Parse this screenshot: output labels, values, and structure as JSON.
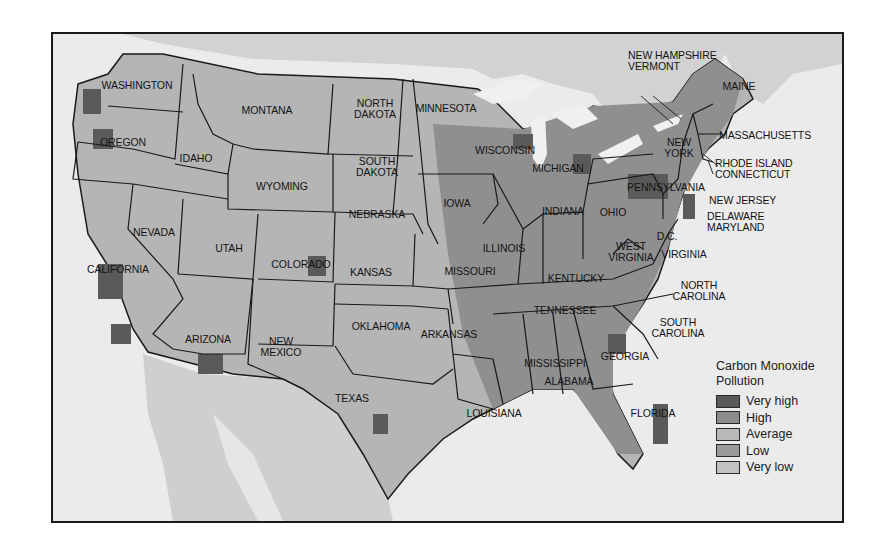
{
  "map": {
    "title": "Carbon Monoxide Pollution",
    "frame": {
      "left": 51,
      "top": 32,
      "width": 789,
      "height": 487
    },
    "colors": {
      "background_land_foreign": "#d0d0d0",
      "water": "#ececec",
      "border": "#1a1a1a"
    },
    "state_labels": [
      {
        "text": "WASHINGTON",
        "x": 84,
        "y": 51
      },
      {
        "text": "OREGON",
        "x": 70,
        "y": 108
      },
      {
        "text": "IDAHO",
        "x": 143,
        "y": 124
      },
      {
        "text": "MONTANA",
        "x": 214,
        "y": 76
      },
      {
        "text": "WYOMING",
        "x": 229,
        "y": 152
      },
      {
        "text": "NORTH\nDAKOTA",
        "x": 322,
        "y": 75
      },
      {
        "text": "SOUTH\nDAKOTA",
        "x": 324,
        "y": 133
      },
      {
        "text": "MINNESOTA",
        "x": 393,
        "y": 74
      },
      {
        "text": "WISCONSIN",
        "x": 452,
        "y": 116
      },
      {
        "text": "MICHIGAN",
        "x": 505,
        "y": 134
      },
      {
        "text": "NEBRASKA",
        "x": 324,
        "y": 180
      },
      {
        "text": "IOWA",
        "x": 404,
        "y": 169
      },
      {
        "text": "NEVADA",
        "x": 101,
        "y": 198
      },
      {
        "text": "UTAH",
        "x": 176,
        "y": 214
      },
      {
        "text": "COLORADO",
        "x": 248,
        "y": 230
      },
      {
        "text": "CALIFORNIA",
        "x": 65,
        "y": 235
      },
      {
        "text": "KANSAS",
        "x": 318,
        "y": 238
      },
      {
        "text": "ILLINOIS",
        "x": 451,
        "y": 214
      },
      {
        "text": "INDIANA",
        "x": 510,
        "y": 177
      },
      {
        "text": "OHIO",
        "x": 560,
        "y": 178
      },
      {
        "text": "MISSOURI",
        "x": 417,
        "y": 237
      },
      {
        "text": "KENTUCKY",
        "x": 523,
        "y": 244
      },
      {
        "text": "WEST\nVIRGINIA",
        "x": 578,
        "y": 218
      },
      {
        "text": "D.C.",
        "x": 614,
        "y": 202
      },
      {
        "text": "VIRGINIA",
        "x": 631,
        "y": 220
      },
      {
        "text": "PENNSYLVANIA",
        "x": 613,
        "y": 153
      },
      {
        "text": "NEW\nYORK",
        "x": 626,
        "y": 114
      },
      {
        "text": "ARIZONA",
        "x": 155,
        "y": 305
      },
      {
        "text": "NEW\nMEXICO",
        "x": 228,
        "y": 313
      },
      {
        "text": "OKLAHOMA",
        "x": 328,
        "y": 292
      },
      {
        "text": "ARKANSAS",
        "x": 396,
        "y": 300
      },
      {
        "text": "TENNESSEE",
        "x": 512,
        "y": 276
      },
      {
        "text": "NORTH\nCAROLINA",
        "x": 646,
        "y": 257
      },
      {
        "text": "SOUTH\nCAROLINA",
        "x": 625,
        "y": 294
      },
      {
        "text": "TEXAS",
        "x": 299,
        "y": 364
      },
      {
        "text": "MISSISSIPPI",
        "x": 502,
        "y": 329
      },
      {
        "text": "ALABAMA",
        "x": 516,
        "y": 347
      },
      {
        "text": "GEORGIA",
        "x": 572,
        "y": 322
      },
      {
        "text": "LOUISIANA",
        "x": 441,
        "y": 379
      },
      {
        "text": "FLORIDA",
        "x": 600,
        "y": 379
      },
      {
        "text": "MAINE",
        "x": 686,
        "y": 52
      }
    ],
    "callout_labels": [
      {
        "text": "NEW HAMPSHIRE\nVERMONT",
        "x": 575,
        "y": 27
      },
      {
        "text": "MASSACHUSETTS",
        "x": 666,
        "y": 101
      },
      {
        "text": "RHODE ISLAND\nCONNECTICUT",
        "x": 662,
        "y": 135
      },
      {
        "text": "NEW JERSEY",
        "x": 656,
        "y": 166
      },
      {
        "text": "DELAWARE\nMARYLAND",
        "x": 654,
        "y": 188
      }
    ]
  },
  "legend": {
    "title": "Carbon Monoxide\nPollution",
    "items": [
      {
        "label": "Very high",
        "color": "#5a5a5a"
      },
      {
        "label": "High",
        "color": "#8c8c8c"
      },
      {
        "label": "Average",
        "color": "#b8b8b8"
      },
      {
        "label": "Low",
        "color": "#9a9a9a"
      },
      {
        "label": "Very low",
        "color": "#c2c2c2"
      }
    ]
  }
}
